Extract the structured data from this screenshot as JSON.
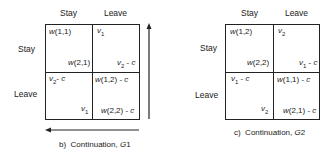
{
  "figure_b": {
    "caption": "b)  Continuation, G1",
    "col_headers": [
      "Stay",
      "Leave"
    ],
    "row_headers": [
      "Stay",
      "Leave"
    ],
    "cells": [
      [
        {
          "top": "w(1,1)",
          "bottom": "w(2,1)"
        },
        {
          "top": "v1",
          "bottom": "v2 - c"
        }
      ],
      [
        {
          "top": "v2 - c",
          "bottom": "v1"
        },
        {
          "top": "w(1,2) - c",
          "bottom": "w(2,2) - c"
        }
      ]
    ],
    "arrows": [
      "up (right side)",
      "left (bottom)"
    ]
  },
  "figure_c": {
    "caption": "c)  Continuation, G2",
    "col_headers": [
      "Stay",
      "Leave"
    ],
    "row_headers": [
      "Stay",
      "Leave"
    ],
    "cells": [
      [
        {
          "top": "w(1,2)",
          "bottom": "w(2,2)"
        },
        {
          "top": "v2",
          "bottom": "v1 - c"
        }
      ],
      [
        {
          "top": "v1 - c",
          "bottom": "v2"
        },
        {
          "top": "w(1,1) - c",
          "bottom": "w(2,1) - c"
        }
      ]
    ]
  }
}
